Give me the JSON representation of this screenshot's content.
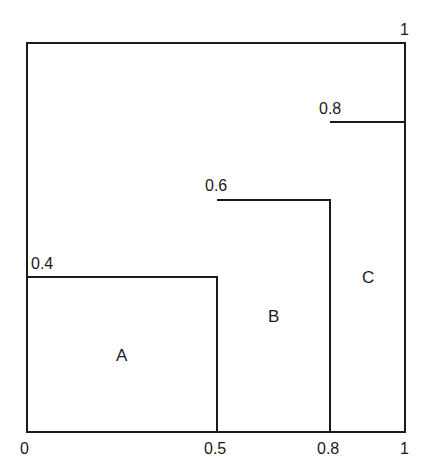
{
  "diagram": {
    "type": "step-region diagram (unit square)",
    "outer_box": {
      "x": [
        0,
        1
      ],
      "y": [
        0,
        1
      ]
    },
    "corner_label": "1",
    "x_labels": [
      "0",
      "0.5",
      "0.8",
      "1"
    ],
    "height_labels": [
      "0.4",
      "0.6",
      "0.8"
    ],
    "regions": [
      {
        "label": "A",
        "x_from": 0,
        "x_to": 0.5,
        "height": 0.4,
        "height_label": "0.4"
      },
      {
        "label": "B",
        "x_from": 0.5,
        "x_to": 0.8,
        "height": 0.6,
        "height_label": "0.6"
      },
      {
        "label": "C",
        "x_from": 0.8,
        "x_to": 1,
        "height": 0.8,
        "height_label": "0.8"
      }
    ],
    "line_color": "#1a1a1a"
  }
}
